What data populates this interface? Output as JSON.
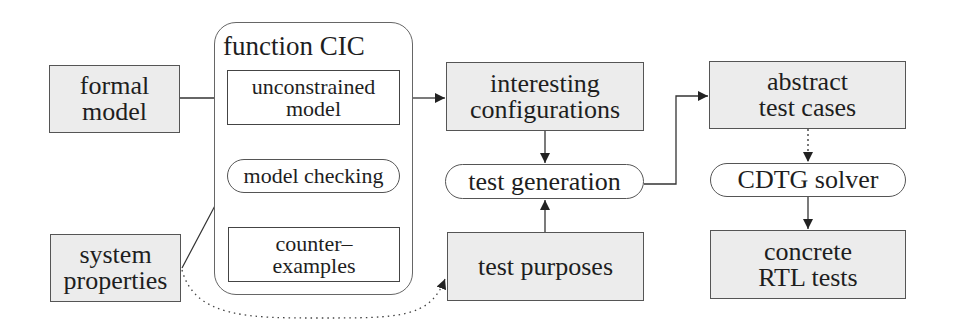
{
  "diagram": {
    "container": {
      "title": "function CIC"
    },
    "nodes": {
      "formal_model": {
        "lines": [
          "formal",
          "model"
        ],
        "style": "gray-box"
      },
      "system_properties": {
        "lines": [
          "system",
          "properties"
        ],
        "style": "gray-box"
      },
      "unconstrained_model": {
        "lines": [
          "unconstrained",
          "model"
        ],
        "style": "white-box"
      },
      "model_checking": {
        "label": "model checking",
        "style": "pill"
      },
      "counter_examples": {
        "lines": [
          "counter–",
          "examples"
        ],
        "style": "white-box"
      },
      "interesting_configurations": {
        "lines": [
          "interesting",
          "configurations"
        ],
        "style": "gray-box"
      },
      "test_generation": {
        "label": "test generation",
        "style": "pill"
      },
      "test_purposes": {
        "label": "test purposes",
        "style": "gray-box"
      },
      "abstract_test_cases": {
        "lines": [
          "abstract",
          "test cases"
        ],
        "style": "gray-box"
      },
      "cdtg_solver": {
        "label": "CDTG solver",
        "style": "pill"
      },
      "concrete_rtl_tests": {
        "lines": [
          "concrete",
          "RTL tests"
        ],
        "style": "gray-box"
      }
    },
    "edges": [
      {
        "from": "formal model",
        "to": "unconstrained model",
        "style": "solid"
      },
      {
        "from": "unconstrained model",
        "to": "model checking",
        "style": "solid"
      },
      {
        "from": "model checking",
        "to": "counter-examples",
        "style": "solid"
      },
      {
        "from": "system properties",
        "to": "model checking",
        "style": "solid"
      },
      {
        "from": "system properties",
        "to": "test purposes",
        "style": "dotted"
      },
      {
        "from": "function CIC",
        "to": "interesting configurations",
        "style": "solid"
      },
      {
        "from": "interesting configurations",
        "to": "test generation",
        "style": "solid"
      },
      {
        "from": "test purposes",
        "to": "test generation",
        "style": "solid"
      },
      {
        "from": "test generation",
        "to": "abstract test cases",
        "style": "solid"
      },
      {
        "from": "abstract test cases",
        "to": "CDTG solver",
        "style": "dotted"
      },
      {
        "from": "CDTG solver",
        "to": "concrete RTL tests",
        "style": "solid"
      }
    ],
    "colors": {
      "box_fill": "#ececec",
      "border": "#555555",
      "text": "#1e1e1e",
      "arrow": "#222222"
    }
  }
}
